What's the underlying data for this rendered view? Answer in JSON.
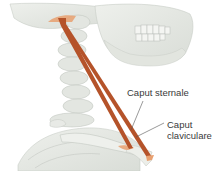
{
  "figure": {
    "muscle_color": "#b5532a",
    "attachment_color": "#e8a070",
    "bone_color": "#e6e8e4",
    "labels": [
      {
        "id": "caput-sternale",
        "text": "Caput sternale"
      },
      {
        "id": "caput-claviculare",
        "line1": "Caput",
        "line2": "claviculare"
      }
    ]
  }
}
